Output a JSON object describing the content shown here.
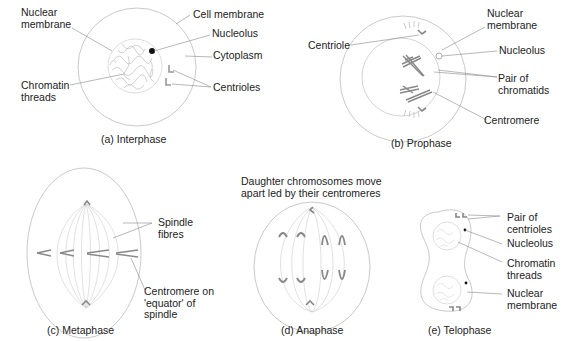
{
  "diagram": {
    "colors": {
      "line": "#aaaaaa",
      "leader": "#888888",
      "chromosome": "#8a8a8a",
      "text": "#222222"
    },
    "panels": [
      {
        "id": "a",
        "caption": "(a) Interphase",
        "labels": {
          "nuclear_membrane": "Nuclear\nmembrane",
          "cell_membrane": "Cell membrane",
          "nucleolus": "Nucleolus",
          "cytoplasm": "Cytoplasm",
          "chromatin_threads": "Chromatin\nthreads",
          "centrioles": "Centrioles"
        }
      },
      {
        "id": "b",
        "caption": "(b) Prophase",
        "labels": {
          "centriole": "Centriole",
          "nuclear_membrane": "Nuclear\nmembrane",
          "nucleolus": "Nucleolus",
          "pair_of_chromatids": "Pair of\nchromatids",
          "centromere": "Centromere"
        }
      },
      {
        "id": "c",
        "caption": "(c) Metaphase",
        "labels": {
          "spindle_fibres": "Spindle\nfibres",
          "centromere_equator": "Centromere on\n'equator' of\nspindle"
        }
      },
      {
        "id": "d",
        "caption": "(d) Anaphase",
        "labels": {
          "daughter_chromosomes": "Daughter chromosomes move\napart led by their centromeres"
        }
      },
      {
        "id": "e",
        "caption": "(e) Telophase",
        "labels": {
          "pair_of_centrioles": "Pair of\ncentrioles",
          "nucleolus": "Nucleolus",
          "chromatin_threads": "Chromatin\nthreads",
          "nuclear_membrane": "Nuclear\nmembrane"
        }
      }
    ]
  }
}
